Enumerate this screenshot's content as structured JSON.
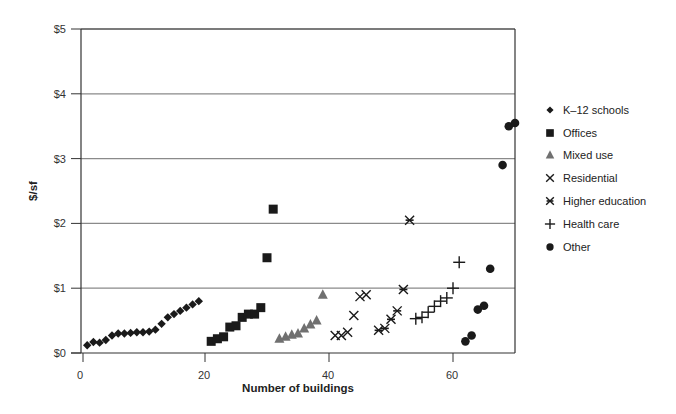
{
  "chart_data": {
    "type": "scatter",
    "title": "",
    "xlabel": "Number of buildings",
    "ylabel": "$/sf",
    "xlim": [
      0,
      70
    ],
    "ylim": [
      0,
      5
    ],
    "x_ticks": [
      0,
      20,
      40,
      60
    ],
    "x_tick_labels": [
      "0",
      "20",
      "40",
      "60"
    ],
    "y_ticks": [
      0,
      1,
      2,
      3,
      4,
      5
    ],
    "y_tick_labels": [
      "$0",
      "$1",
      "$2",
      "$3",
      "$4",
      "$5"
    ],
    "grid": "horizontal",
    "legend_position": "right",
    "series": [
      {
        "name": "K–12 schools",
        "marker": "diamond",
        "x": [
          1,
          2,
          3,
          4,
          5,
          6,
          7,
          8,
          9,
          10,
          11,
          12,
          13,
          14,
          15,
          16,
          17,
          18,
          19
        ],
        "y": [
          0.12,
          0.17,
          0.16,
          0.2,
          0.27,
          0.3,
          0.3,
          0.31,
          0.32,
          0.32,
          0.33,
          0.36,
          0.45,
          0.55,
          0.6,
          0.65,
          0.7,
          0.75,
          0.8
        ]
      },
      {
        "name": "Offices",
        "marker": "square",
        "x": [
          21,
          22,
          23,
          24,
          25,
          26,
          27,
          28,
          29,
          30,
          31
        ],
        "y": [
          0.18,
          0.22,
          0.25,
          0.4,
          0.42,
          0.55,
          0.6,
          0.6,
          0.7,
          1.47,
          2.22
        ]
      },
      {
        "name": "Mixed use",
        "marker": "triangle",
        "x": [
          32,
          33,
          34,
          35,
          36,
          37,
          38,
          39
        ],
        "y": [
          0.22,
          0.25,
          0.28,
          0.3,
          0.38,
          0.44,
          0.5,
          0.9
        ]
      },
      {
        "name": "Residential",
        "marker": "x",
        "x": [
          41,
          42,
          43,
          44,
          45,
          46
        ],
        "y": [
          0.27,
          0.27,
          0.32,
          0.58,
          0.87,
          0.9
        ]
      },
      {
        "name": "Higher education",
        "marker": "asterisk",
        "x": [
          48,
          49,
          50,
          51,
          52,
          53
        ],
        "y": [
          0.35,
          0.38,
          0.52,
          0.65,
          0.98,
          2.05
        ]
      },
      {
        "name": "Health care",
        "marker": "plus",
        "x": [
          54,
          55,
          56,
          57,
          58,
          59,
          60,
          61
        ],
        "y": [
          0.53,
          0.55,
          0.63,
          0.72,
          0.8,
          0.85,
          1.0,
          1.4
        ]
      },
      {
        "name": "Other",
        "marker": "circle",
        "x": [
          62,
          63,
          64,
          65,
          66,
          68,
          69,
          70
        ],
        "y": [
          0.18,
          0.27,
          0.67,
          0.73,
          1.3,
          2.9,
          3.5,
          3.55
        ]
      }
    ]
  },
  "legend": {
    "items": [
      {
        "label": "K–12 schools",
        "marker": "diamond-icon"
      },
      {
        "label": "Offices",
        "marker": "square-icon"
      },
      {
        "label": "Mixed use",
        "marker": "triangle-icon"
      },
      {
        "label": "Residential",
        "marker": "x-icon"
      },
      {
        "label": "Higher education",
        "marker": "asterisk-icon"
      },
      {
        "label": "Health care",
        "marker": "plus-icon"
      },
      {
        "label": "Other",
        "marker": "circle-icon"
      }
    ]
  },
  "colors": {
    "marker": "#1a1a1a",
    "triangle": "#707070",
    "grid": "#8a8a8a",
    "axis": "#333333"
  }
}
